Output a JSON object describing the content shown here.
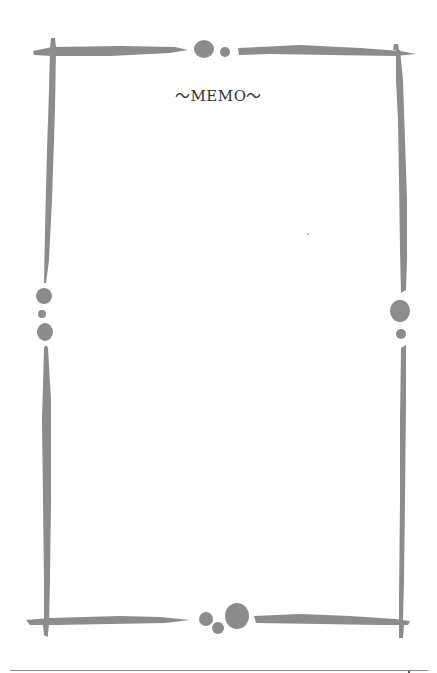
{
  "memo": {
    "title": "～MEMO～"
  },
  "colors": {
    "frame": "#8c8c8c",
    "title_text": "#333333",
    "background": "#ffffff",
    "rule": "#8a8a8a"
  },
  "icons": {
    "frame": "decorative-brush-frame",
    "dots": "decorative-dot-cluster"
  }
}
